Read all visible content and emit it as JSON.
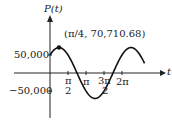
{
  "chart_data": {
    "type": "line",
    "title": "",
    "xlabel": "t",
    "ylabel": "P(t)",
    "x_ticks": [
      "π/2",
      "π",
      "3π/2",
      "2π"
    ],
    "y_ticks": [
      "50,000",
      "−50,000"
    ],
    "annotations": [
      {
        "label": "(π/4, 70,710.68)",
        "x": 0.7854,
        "y": 70710.68
      }
    ],
    "series": [
      {
        "name": "P(t)",
        "function": "50000 sin t + 50000 cos t",
        "x": [
          0,
          0.7854,
          1.5708,
          2.3562,
          3.1416,
          3.927,
          4.7124,
          5.4978,
          6.2832,
          7.0686,
          7.854
        ],
        "values": [
          50000,
          70710.68,
          50000,
          0,
          -50000,
          -70710.68,
          -50000,
          0,
          50000,
          70710.68,
          50000
        ]
      }
    ],
    "xlim": [
      0,
      8.4
    ],
    "ylim": [
      -85000,
      100000
    ],
    "grid": false
  },
  "labels": {
    "y_axis": "P(t)",
    "x_axis": "t",
    "point": "(π/4, 70,710.68)",
    "y_pos": "50,000",
    "y_neg": "−50,000",
    "pi_half": "π",
    "pi_half_den": "2",
    "pi": "π",
    "three_pi_half": "3π",
    "three_pi_half_den": "2",
    "two_pi": "2π"
  }
}
